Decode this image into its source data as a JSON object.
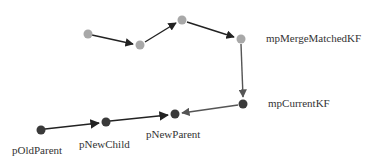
{
  "diagram": {
    "labels": {
      "merge": "mpMergeMatchedKF",
      "current": "mpCurrentKF",
      "old_parent": "pOldParent",
      "new_child": "pNewChild",
      "new_parent": "pNewParent"
    },
    "colors": {
      "gray_node": "#a8a8a8",
      "dark_node": "#3a3a3a",
      "edge": "#222222",
      "edge_light": "#555555"
    },
    "nodes": [
      {
        "id": "g1",
        "x": 88,
        "y": 34,
        "kind": "gray"
      },
      {
        "id": "g2",
        "x": 140,
        "y": 45,
        "kind": "gray"
      },
      {
        "id": "g3",
        "x": 182,
        "y": 20,
        "kind": "gray"
      },
      {
        "id": "g4",
        "x": 241,
        "y": 39,
        "kind": "gray",
        "label": "mpMergeMatchedKF"
      },
      {
        "id": "c",
        "x": 243,
        "y": 104,
        "kind": "dark",
        "label": "mpCurrentKF"
      },
      {
        "id": "np",
        "x": 175,
        "y": 114,
        "kind": "dark",
        "label": "pNewParent"
      },
      {
        "id": "nc",
        "x": 106,
        "y": 122,
        "kind": "dark",
        "label": "pNewChild"
      },
      {
        "id": "op",
        "x": 41,
        "y": 130,
        "kind": "dark",
        "label": "pOldParent"
      }
    ],
    "edges": [
      {
        "from": "g1",
        "to": "g2"
      },
      {
        "from": "g2",
        "to": "g3"
      },
      {
        "from": "g3",
        "to": "g4"
      },
      {
        "from": "g4",
        "to": "c"
      },
      {
        "from": "c",
        "to": "np"
      },
      {
        "from": "op",
        "to": "nc"
      },
      {
        "from": "nc",
        "to": "np"
      }
    ]
  }
}
